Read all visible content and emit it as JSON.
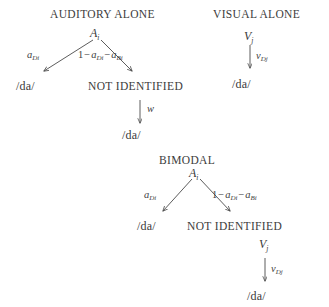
{
  "figure": {
    "background_color": "#ffffff",
    "ink_color": "#3a3a3a"
  },
  "sections": {
    "auditory": {
      "heading": "AUDITORY ALONE",
      "root": {
        "base": "A",
        "sub": "i"
      },
      "left_edge_label": {
        "base": "a",
        "sub": "Di"
      },
      "right_edge_label": {
        "number": "1",
        "minus_one": "−",
        "term_one_base": "a",
        "term_one_sub": "Di",
        "minus_two": "−",
        "term_two_base": "a",
        "term_two_sub": "Bi"
      },
      "left_outcome": "/da/",
      "right_outcome": "NOT IDENTIFIED",
      "recovery_edge_label": "w",
      "recovery_outcome": "/da/"
    },
    "visual": {
      "heading": "VISUAL ALONE",
      "root": {
        "base": "V",
        "sub": "j"
      },
      "edge_label": {
        "base": "v",
        "sub": "Dj"
      },
      "outcome": "/da/"
    },
    "bimodal": {
      "heading": "BIMODAL",
      "root": {
        "base": "A",
        "sub": "i"
      },
      "left_edge_label": {
        "base": "a",
        "sub": "Di"
      },
      "right_edge_label": {
        "number": "1",
        "minus_one": "−",
        "term_one_base": "a",
        "term_one_sub": "Di",
        "minus_two": "−",
        "term_two_base": "a",
        "term_two_sub": "Bi"
      },
      "left_outcome": "/da/",
      "right_outcome": "NOT IDENTIFIED",
      "secondary_node": {
        "base": "V",
        "sub": "j"
      },
      "secondary_edge_label": {
        "base": "v",
        "sub": "Dj"
      },
      "secondary_outcome": "/da/"
    }
  }
}
